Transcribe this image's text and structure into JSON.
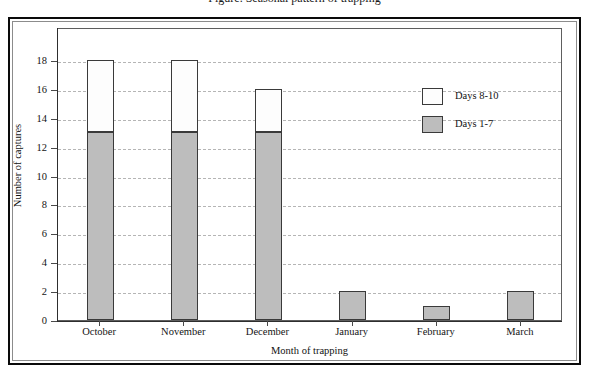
{
  "caption": {
    "clipped_text": "Figure. Seasonal pattern of trapping"
  },
  "chart_data": {
    "type": "bar",
    "subtype": "stacked",
    "title": "",
    "xlabel": "Month of trapping",
    "ylabel": "Number of captures",
    "categories": [
      "October",
      "November",
      "December",
      "January",
      "February",
      "March"
    ],
    "series": [
      {
        "name": "Days 1-7",
        "color": "#bdbdbd",
        "values": [
          13,
          13,
          13,
          2,
          1,
          2
        ]
      },
      {
        "name": "Days 8-10",
        "color": "#fdfdfd",
        "values": [
          5,
          5,
          3,
          0,
          0,
          0
        ]
      }
    ],
    "totals": [
      18,
      18,
      16,
      2,
      1,
      2
    ],
    "ylim": [
      0,
      18
    ],
    "ytick_labels": [
      "0",
      "2",
      "4",
      "6",
      "8",
      "10",
      "12",
      "14",
      "16",
      "18"
    ],
    "ytick_values": [
      0,
      2,
      4,
      6,
      8,
      10,
      12,
      14,
      16,
      18
    ],
    "grid": "horizontal-dashed",
    "legend_position": "upper-right-inside"
  },
  "legend": {
    "entries": [
      {
        "label": "Days 8-10",
        "color": "#fdfdfd"
      },
      {
        "label": "Days 1-7",
        "color": "#bdbdbd"
      }
    ]
  }
}
